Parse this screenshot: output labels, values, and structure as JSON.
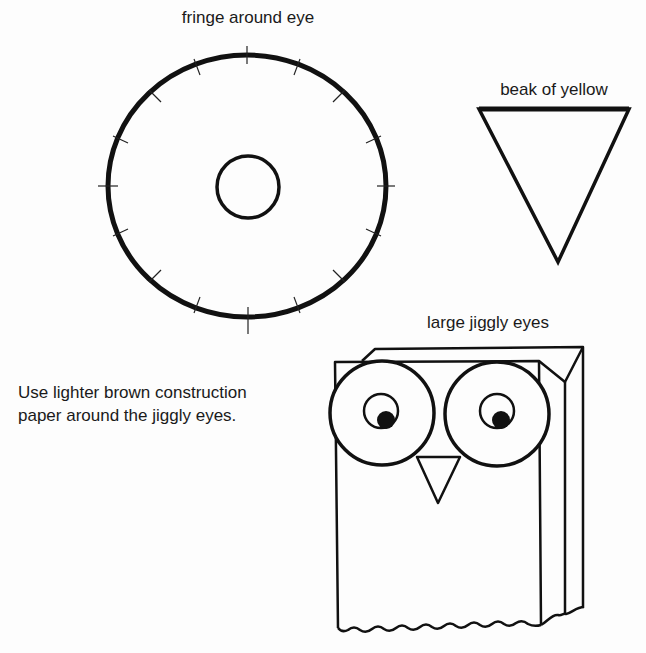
{
  "labels": {
    "fringe": "fringe around eye",
    "beak": "beak of yellow",
    "eyes": "large jiggly eyes"
  },
  "instructions": {
    "line1": "Use lighter brown construction",
    "line2": "paper around the jiggly eyes."
  },
  "colors": {
    "ink": "#111111",
    "paper": "#fdfdfd"
  },
  "fringe_template": {
    "outer_circle": {
      "cx": 247,
      "cy": 186,
      "rx": 139,
      "ry": 131
    },
    "inner_circle": {
      "cx": 248,
      "cy": 187,
      "r": 31
    },
    "tick_count": 16
  },
  "beak_template": {
    "points": [
      [
        479,
        109
      ],
      [
        629,
        109
      ],
      [
        558,
        262
      ]
    ]
  }
}
